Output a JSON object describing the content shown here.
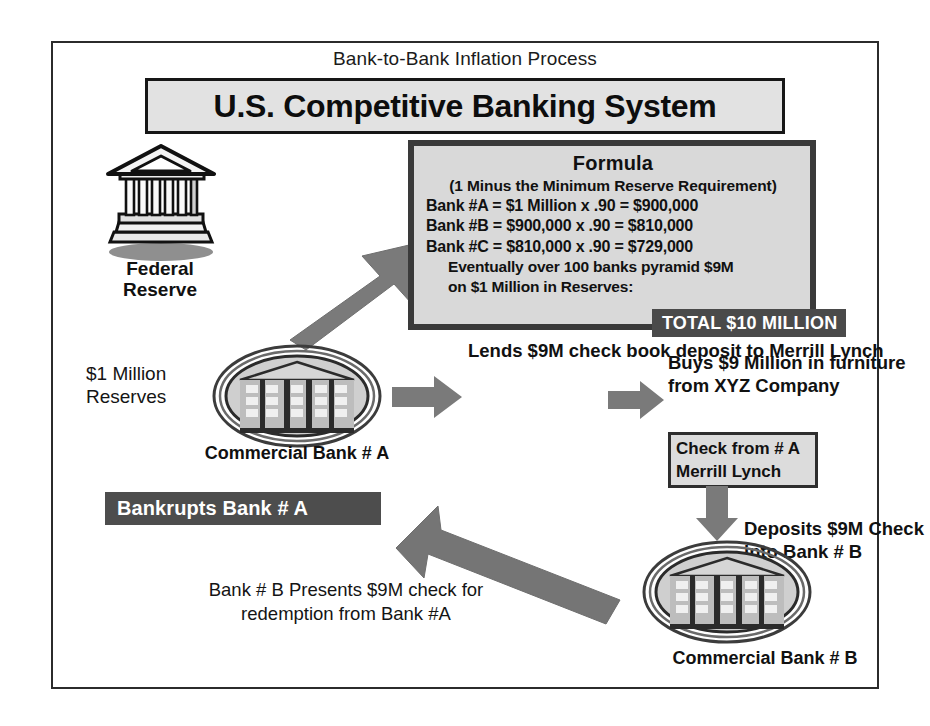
{
  "title": {
    "supertitle": "Bank-to-Bank Inflation Process",
    "main": "U.S. Competitive Banking System"
  },
  "formula": {
    "heading": "Formula",
    "subheading": "(1 Minus the Minimum Reserve Requirement)",
    "lines": [
      "Bank #A = $1 Million x .90 = $900,000",
      "Bank #B = $900,000 x .90 = $810,000",
      "Bank #C = $810,000 x .90 = $729,000"
    ],
    "note_line_1": "Eventually over 100 banks pyramid $9M",
    "note_line_2": "on  $1 Million in Reserves:",
    "total_badge": "TOTAL $10 MILLION"
  },
  "nodes": {
    "federal_reserve": "Federal\nReserve",
    "reserves": "$1 Million\nReserves",
    "commercial_bank_a": "Commercial Bank # A",
    "commercial_bank_b": "Commercial Bank # B"
  },
  "flow": {
    "lends": "Lends\n$9M\ncheck book\ndeposit to\nMerrill Lynch",
    "buys": "Buys $9 Million\nin furniture from\nXYZ Company",
    "check_line_1": "Check from # A",
    "check_line_2": "Merrill Lynch",
    "deposits": "Deposits $9M\nCheck into\nBank # B",
    "bankrupts_badge": "Bankrupts Bank # A",
    "presents": "Bank # B\nPresents $9M check for\nredemption from Bank #A"
  },
  "colors": {
    "frame_border": "#2b2b2b",
    "title_fill": "#e2e2e2",
    "formula_fill": "#d9d9d9",
    "formula_border": "#3a3a3a",
    "badge_fill": "#4a4a4a",
    "badge_text": "#ffffff",
    "arrow_fill": "#777777",
    "text": "#141414"
  },
  "icons": {
    "federal_reserve": "classical-bank-building-icon",
    "bank_a": "oval-bank-seal-icon",
    "bank_b": "oval-bank-seal-icon",
    "arrow_to_formula": "arrow-up-right-icon",
    "arrow_lends": "arrow-right-icon",
    "arrow_buys": "arrow-right-icon",
    "arrow_check_down": "arrow-down-icon",
    "arrow_bankrupts": "arrow-up-left-icon"
  }
}
